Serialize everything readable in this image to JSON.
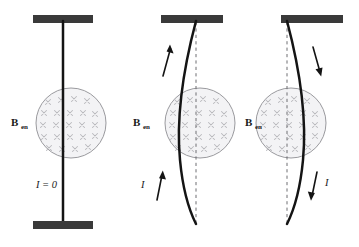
{
  "figure": {
    "background_color": "#ffffff",
    "width": 359,
    "height": 247
  },
  "colors": {
    "wire": "#141414",
    "support": "#3a3a3a",
    "field_circle_fill": "#f3f3f5",
    "field_circle_stroke": "#8e8e93",
    "x_mark": "#b9b9bd",
    "dashed_reference": "#6e6e72",
    "text": "#1a1a1a"
  },
  "field_region": {
    "symbol": "x",
    "meaning": "magnetic-field-into-page",
    "rows": 6,
    "columns": 5
  },
  "panels": [
    {
      "id": "panel-no-current",
      "index": 1,
      "field_label_main": "B",
      "field_label_sub": "en",
      "current_label": "I = 0",
      "current_state": "zero",
      "current_direction": "none",
      "wire_shape": "straight",
      "deflection": "none",
      "has_dashed_reference": false,
      "arrows": []
    },
    {
      "id": "panel-current-up",
      "index": 2,
      "field_label_main": "B",
      "field_label_sub": "en",
      "current_label": "I",
      "current_state": "nonzero",
      "current_direction": "up",
      "wire_shape": "bowed",
      "deflection": "left",
      "has_dashed_reference": true,
      "arrows": [
        {
          "name": "upper-current-arrow",
          "direction": "up"
        },
        {
          "name": "lower-current-arrow",
          "direction": "up"
        }
      ]
    },
    {
      "id": "panel-current-down",
      "index": 3,
      "field_label_main": "B",
      "field_label_sub": "en",
      "current_label": "I",
      "current_state": "nonzero",
      "current_direction": "down",
      "wire_shape": "bowed",
      "deflection": "right",
      "has_dashed_reference": true,
      "arrows": [
        {
          "name": "upper-current-arrow",
          "direction": "down"
        },
        {
          "name": "lower-current-arrow",
          "direction": "down"
        }
      ]
    }
  ]
}
